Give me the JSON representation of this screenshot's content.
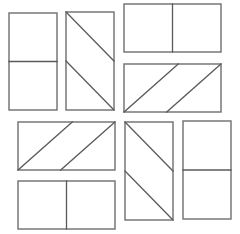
{
  "figure": {
    "canvas": {
      "width": 240,
      "height": 234
    },
    "colors": {
      "background": "#ffffff",
      "shaded_fill": "#ececec",
      "unshaded_fill": "#ffffff",
      "outline": "#6e6e6e",
      "divider": "#5a5a5a"
    },
    "shape_count": 8,
    "shapes": [
      {
        "id": "shape-1",
        "name": "vertical-rectangle-horizontal-split-top-shaded",
        "orientation": "portrait",
        "division": "horizontal-line",
        "shaded_part": "top",
        "fraction_shaded": "1/2",
        "x": 9,
        "y": 13,
        "width": 48,
        "height": 97,
        "split_at": 0.5
      },
      {
        "id": "shape-2",
        "name": "vertical-rectangle-diagonal-band-shaded",
        "orientation": "portrait",
        "division": "parallel-diagonals",
        "shaded_part": "middle-band",
        "fraction_shaded": "1/2",
        "x": 66,
        "y": 12,
        "width": 48,
        "height": 98,
        "split_at": 0.5
      },
      {
        "id": "shape-3",
        "name": "horizontal-rectangle-vertical-split-right-shaded",
        "orientation": "landscape",
        "division": "vertical-line",
        "shaded_part": "right",
        "fraction_shaded": "1/2",
        "x": 124,
        "y": 4,
        "width": 97,
        "height": 48,
        "split_at": 0.5
      },
      {
        "id": "shape-4",
        "name": "horizontal-rectangle-diagonal-band-shaded",
        "orientation": "landscape",
        "division": "parallel-diagonals",
        "shaded_part": "middle-band",
        "fraction_shaded": "1/2",
        "x": 124,
        "y": 64,
        "width": 97,
        "height": 48,
        "split_at": 0.5
      },
      {
        "id": "shape-5",
        "name": "horizontal-rectangle-diagonal-band-shaded-lower-left",
        "orientation": "landscape",
        "division": "parallel-diagonals",
        "shaded_part": "middle-band",
        "fraction_shaded": "1/2",
        "x": 18,
        "y": 122,
        "width": 97,
        "height": 48,
        "split_at": 0.5
      },
      {
        "id": "shape-6",
        "name": "horizontal-rectangle-vertical-split-left-shaded",
        "orientation": "landscape",
        "division": "vertical-line",
        "shaded_part": "left",
        "fraction_shaded": "1/2",
        "x": 18,
        "y": 181,
        "width": 97,
        "height": 48,
        "split_at": 0.5
      },
      {
        "id": "shape-7",
        "name": "vertical-rectangle-diagonal-band-shaded-lower-right",
        "orientation": "portrait",
        "division": "parallel-diagonals",
        "shaded_part": "middle-band",
        "fraction_shaded": "1/2",
        "x": 125,
        "y": 122,
        "width": 48,
        "height": 98,
        "split_at": 0.5
      },
      {
        "id": "shape-8",
        "name": "vertical-rectangle-horizontal-split-bottom-shaded",
        "orientation": "portrait",
        "division": "horizontal-line",
        "shaded_part": "bottom",
        "fraction_shaded": "1/2",
        "x": 183,
        "y": 121,
        "width": 48,
        "height": 98,
        "split_at": 0.5
      }
    ]
  }
}
